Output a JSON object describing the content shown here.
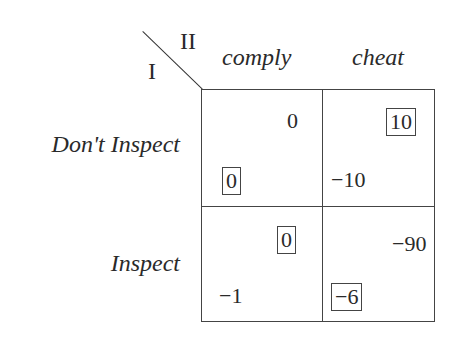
{
  "diagram": {
    "type": "payoff-matrix",
    "player_row": "I",
    "player_col": "II",
    "columns": [
      "comply",
      "cheat"
    ],
    "rows": [
      "Don't Inspect",
      "Inspect"
    ],
    "cells": [
      [
        {
          "row_payoff": "0",
          "col_payoff": "0",
          "row_best": true,
          "col_best": false
        },
        {
          "row_payoff": "−10",
          "col_payoff": "10",
          "row_best": false,
          "col_best": true
        }
      ],
      [
        {
          "row_payoff": "−1",
          "col_payoff": "0",
          "row_best": false,
          "col_best": true
        },
        {
          "row_payoff": "−6",
          "col_payoff": "−90",
          "row_best": true,
          "col_best": false
        }
      ]
    ]
  }
}
